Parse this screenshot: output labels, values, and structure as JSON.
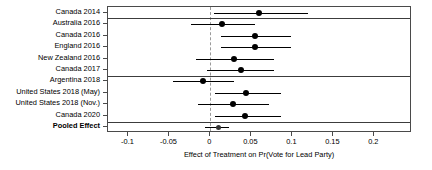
{
  "chart_data": {
    "type": "scatter",
    "subtype": "forest-plot",
    "title": "",
    "xlabel": "Effect of Treatment on Pr(Vote for Lead Party)",
    "ylabel": "",
    "xlim": [
      -0.125,
      0.246
    ],
    "xticks": [
      -0.1,
      -0.05,
      0,
      0.05,
      0.1,
      0.15,
      0.2
    ],
    "xtick_labels": [
      "-0.1",
      "-0.05",
      "0",
      "0.05",
      "0.1",
      "0.15",
      "0.2"
    ],
    "grid": false,
    "legend": "none",
    "zero_reference_line": 0,
    "categories": [
      "Canada 2014",
      "Australia 2016",
      "Canada 2016",
      "England 2016",
      "New Zealand 2016",
      "Canada 2017",
      "Argentina 2018",
      "United States 2018 (May)",
      "United States 2018 (Nov.)",
      "Canada 2020",
      "Pooled Effect"
    ],
    "points": [
      {
        "label": "Canada 2014",
        "estimate": 0.059,
        "ci_low": 0.004,
        "ci_high": 0.119,
        "pooled": false
      },
      {
        "label": "Australia 2016",
        "estimate": 0.014,
        "ci_low": -0.024,
        "ci_high": 0.055,
        "pooled": false
      },
      {
        "label": "Canada 2016",
        "estimate": 0.055,
        "ci_low": 0.013,
        "ci_high": 0.098,
        "pooled": false
      },
      {
        "label": "England 2016",
        "estimate": 0.055,
        "ci_low": 0.013,
        "ci_high": 0.098,
        "pooled": false
      },
      {
        "label": "New Zealand 2016",
        "estimate": 0.029,
        "ci_low": -0.018,
        "ci_high": 0.078,
        "pooled": false
      },
      {
        "label": "Canada 2017",
        "estimate": 0.037,
        "ci_low": -0.004,
        "ci_high": 0.078,
        "pooled": false
      },
      {
        "label": "Argentina 2018",
        "estimate": -0.009,
        "ci_low": -0.046,
        "ci_high": 0.029,
        "pooled": false
      },
      {
        "label": "United States 2018 (May)",
        "estimate": 0.043,
        "ci_low": 0.005,
        "ci_high": 0.086,
        "pooled": false
      },
      {
        "label": "United States 2018 (Nov.)",
        "estimate": 0.027,
        "ci_low": -0.015,
        "ci_high": 0.071,
        "pooled": false
      },
      {
        "label": "Canada 2020",
        "estimate": 0.042,
        "ci_low": 0.005,
        "ci_high": 0.086,
        "pooled": false
      },
      {
        "label": "Pooled Effect",
        "estimate": 0.01,
        "ci_low": -0.007,
        "ci_high": 0.023,
        "pooled": true
      }
    ],
    "group_separators_after": [
      1,
      6,
      10
    ]
  }
}
